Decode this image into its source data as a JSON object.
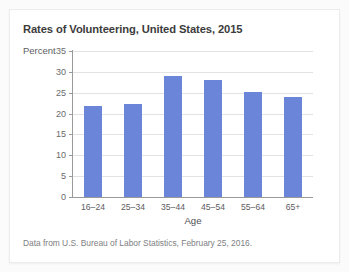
{
  "card": {
    "background": "#ffffff",
    "border_color": "#ececed"
  },
  "chart_data": {
    "type": "bar",
    "title": "Rates of Volunteering, United States, 2015",
    "xlabel": "Age",
    "ylabel": "Percent",
    "categories": [
      "16–24",
      "25–34",
      "35–44",
      "45–54",
      "55–64",
      "65+"
    ],
    "values": [
      21.8,
      22.3,
      28.9,
      28.1,
      25.2,
      23.9
    ],
    "ylim": [
      0,
      35
    ],
    "yticks": [
      0,
      5,
      10,
      15,
      20,
      25,
      30,
      35
    ],
    "ytick_labels": [
      "0",
      "5",
      "10",
      "15",
      "20",
      "25",
      "30",
      "35"
    ],
    "grid": true,
    "grid_axis": "y",
    "legend": false,
    "bar_color": "#6b86d8",
    "grid_color": "#e3e3e4",
    "axis_color": "#9a9a9c",
    "source_note": "Data from U.S. Bureau of Labor Statistics, February 25, 2016."
  }
}
